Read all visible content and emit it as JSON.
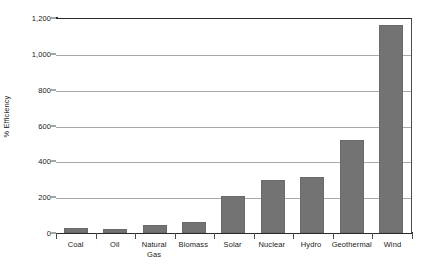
{
  "chart_data": {
    "type": "bar",
    "title": "",
    "xlabel": "",
    "ylabel": "% Efficiency",
    "categories": [
      "Coal",
      "Oil",
      "Natural Gas",
      "Biomass",
      "Solar",
      "Nuclear",
      "Hydro",
      "Geothermal",
      "Wind"
    ],
    "values": [
      30,
      25,
      45,
      60,
      205,
      295,
      315,
      520,
      1160
    ],
    "ylim": [
      0,
      1200
    ],
    "yticks": [
      0,
      200,
      400,
      600,
      800,
      1000,
      1200
    ],
    "ytick_labels": [
      "0",
      "200",
      "400",
      "600",
      "800",
      "1,000",
      "1,200"
    ],
    "grid": true,
    "legend": "none",
    "bar_color": "#737373",
    "gridline_color": "#a9a9a9",
    "axis_color": "#2b2b2b"
  }
}
